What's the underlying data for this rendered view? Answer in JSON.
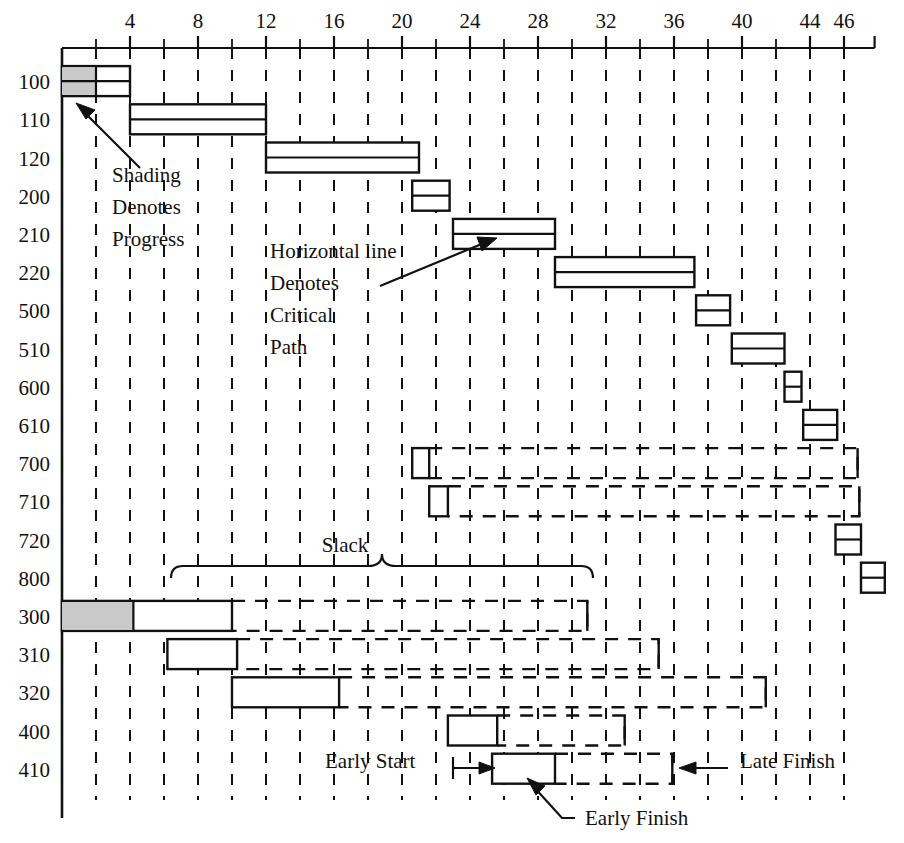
{
  "figure": {
    "kind": "gantt-chart",
    "axis_title": "",
    "row_label_header": ""
  },
  "chart_data": {
    "type": "bar",
    "subtype": "gantt",
    "title": "",
    "xlabel": "",
    "ylabel": "",
    "xlim": [
      0,
      47.5
    ],
    "x_ticks_major": [
      4,
      8,
      12,
      16,
      20,
      24,
      28,
      32,
      36,
      40,
      44,
      46
    ],
    "x_ticks_minor": [
      2,
      6,
      10,
      14,
      18,
      22,
      26,
      30,
      34,
      38,
      42
    ],
    "x_tick_labels": [
      "4",
      "8",
      "12",
      "16",
      "20",
      "24",
      "28",
      "32",
      "36",
      "40",
      "44",
      "46"
    ],
    "grid": "vertical dashed gridlines at every even unit",
    "legend": [],
    "categories": [
      "100",
      "110",
      "120",
      "200",
      "210",
      "220",
      "500",
      "510",
      "600",
      "610",
      "700",
      "710",
      "720",
      "800",
      "300",
      "310",
      "320",
      "400",
      "410"
    ],
    "tasks": [
      {
        "id": "100",
        "early_start": 0,
        "early_finish": 4,
        "late_finish": 4,
        "progress_end": 2,
        "critical": true,
        "shaded": true
      },
      {
        "id": "110",
        "early_start": 4,
        "early_finish": 12,
        "late_finish": 12,
        "progress_end": null,
        "critical": true,
        "shaded": false
      },
      {
        "id": "120",
        "early_start": 12,
        "early_finish": 21,
        "late_finish": 21,
        "progress_end": null,
        "critical": true,
        "shaded": false
      },
      {
        "id": "200",
        "early_start": 20.6,
        "early_finish": 22.8,
        "late_finish": 22.8,
        "progress_end": null,
        "critical": true,
        "shaded": false
      },
      {
        "id": "210",
        "early_start": 23,
        "early_finish": 29,
        "late_finish": 29,
        "progress_end": null,
        "critical": true,
        "shaded": false
      },
      {
        "id": "220",
        "early_start": 29,
        "early_finish": 37.2,
        "late_finish": 37.2,
        "progress_end": null,
        "critical": true,
        "shaded": false
      },
      {
        "id": "500",
        "early_start": 37.3,
        "early_finish": 39.3,
        "late_finish": 39.3,
        "progress_end": null,
        "critical": true,
        "shaded": false
      },
      {
        "id": "510",
        "early_start": 39.4,
        "early_finish": 42.5,
        "late_finish": 42.5,
        "progress_end": null,
        "critical": true,
        "shaded": false
      },
      {
        "id": "600",
        "early_start": 42.5,
        "early_finish": 43.5,
        "late_finish": 43.5,
        "progress_end": null,
        "critical": true,
        "shaded": false
      },
      {
        "id": "610",
        "early_start": 43.6,
        "early_finish": 45.6,
        "late_finish": 45.6,
        "progress_end": null,
        "critical": true,
        "shaded": false
      },
      {
        "id": "700",
        "early_start": 20.6,
        "early_finish": 21.6,
        "late_finish": 46.8,
        "progress_end": null,
        "critical": false,
        "shaded": false
      },
      {
        "id": "710",
        "early_start": 21.6,
        "early_finish": 22.7,
        "late_finish": 46.9,
        "progress_end": null,
        "critical": false,
        "shaded": false
      },
      {
        "id": "720",
        "early_start": 45.5,
        "early_finish": 47,
        "late_finish": 47,
        "progress_end": null,
        "critical": true,
        "shaded": false
      },
      {
        "id": "800",
        "early_start": 47,
        "early_finish": 48.4,
        "late_finish": 48.4,
        "progress_end": null,
        "critical": true,
        "shaded": false
      },
      {
        "id": "300",
        "early_start": 0,
        "early_finish": 10,
        "late_finish": 30.9,
        "progress_end": 4.2,
        "critical": false,
        "shaded": true
      },
      {
        "id": "310",
        "early_start": 6.2,
        "early_finish": 10.3,
        "late_finish": 35.1,
        "progress_end": null,
        "critical": false,
        "shaded": false
      },
      {
        "id": "320",
        "early_start": 10,
        "early_finish": 16.3,
        "late_finish": 41.4,
        "progress_end": null,
        "critical": false,
        "shaded": false
      },
      {
        "id": "400",
        "early_start": 22.7,
        "early_finish": 25.6,
        "late_finish": 33.1,
        "progress_end": null,
        "critical": false,
        "shaded": false
      },
      {
        "id": "410",
        "early_start": 25.3,
        "early_finish": 29,
        "late_finish": 35.9,
        "progress_end": null,
        "critical": false,
        "shaded": false
      }
    ]
  },
  "annotations": {
    "shading": {
      "line1": "Shading",
      "line2": "Denotes",
      "line3": "Progress"
    },
    "critical": {
      "line1": "Horizontal line",
      "line2": "Denotes",
      "line3": "Critical",
      "line4": "Path"
    },
    "slack": "Slack",
    "early_start": "Early Start",
    "late_finish": "Late Finish",
    "early_finish": "Early Finish"
  },
  "colors": {
    "ink": "#111111",
    "progress_fill": "#c9c9c9",
    "bar_fill": "#ffffff",
    "background": "#ffffff"
  }
}
